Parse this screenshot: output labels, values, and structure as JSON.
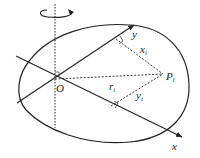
{
  "figure": {
    "labels": {
      "origin": "O",
      "point": "P",
      "point_subscript": "i",
      "x_axis": "x",
      "y_axis": "y",
      "radius": "r",
      "radius_subscript": "i",
      "x_coord": "x",
      "x_coord_subscript": "i",
      "y_coord": "y",
      "y_coord_subscript": "i"
    },
    "colors": {
      "line": "#222222",
      "background": "#ffffff"
    }
  }
}
